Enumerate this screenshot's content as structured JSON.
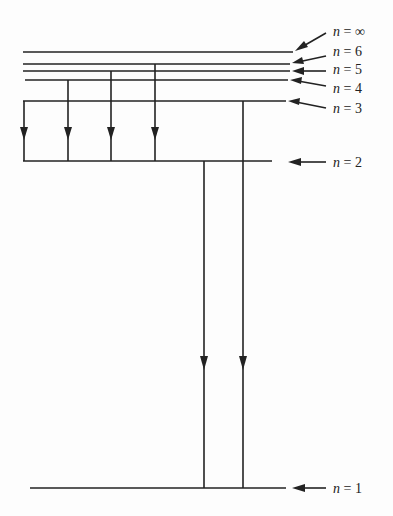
{
  "diagram": {
    "type": "energy-level-diagram",
    "levels": [
      {
        "id": "inf",
        "label_var": "n",
        "label_eq": " = ",
        "label_val": "∞",
        "y": 52,
        "x1": 23,
        "x2": 293
      },
      {
        "id": "6",
        "label_var": "n",
        "label_eq": " = ",
        "label_val": "6",
        "y": 64,
        "x1": 23,
        "x2": 290
      },
      {
        "id": "5",
        "label_var": "n",
        "label_eq": " = ",
        "label_val": "5",
        "y": 71,
        "x1": 23,
        "x2": 290
      },
      {
        "id": "4",
        "label_var": "n",
        "label_eq": " = ",
        "label_val": "4",
        "y": 80,
        "x1": 25,
        "x2": 288
      },
      {
        "id": "3",
        "label_var": "n",
        "label_eq": " = ",
        "label_val": "3",
        "y": 101,
        "x1": 23,
        "x2": 286
      },
      {
        "id": "2",
        "label_var": "n",
        "label_eq": " = ",
        "label_val": "2",
        "y": 161,
        "x1": 23,
        "x2": 272
      },
      {
        "id": "1",
        "label_var": "n",
        "label_eq": " = ",
        "label_val": "1",
        "y": 488,
        "x1": 30,
        "x2": 286
      }
    ],
    "transitions": [
      {
        "from": "3",
        "to": "2",
        "x": 24
      },
      {
        "from": "4",
        "to": "2",
        "x": 68
      },
      {
        "from": "5",
        "to": "2",
        "x": 111
      },
      {
        "from": "6",
        "to": "2",
        "x": 155
      },
      {
        "from": "2",
        "to": "1",
        "x": 204
      },
      {
        "from": "3",
        "to": "1",
        "x": 242
      }
    ],
    "colors": {
      "line": "#222222",
      "background": "#fdfdfd"
    }
  }
}
